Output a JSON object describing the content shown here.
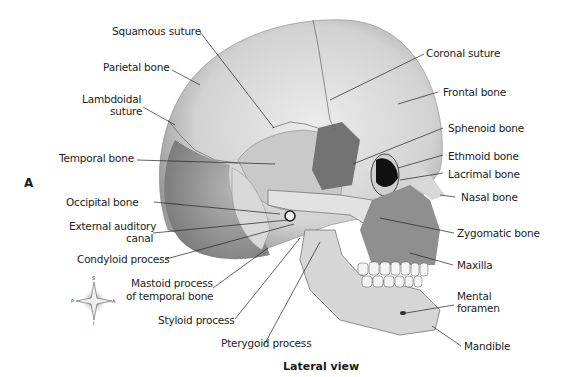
{
  "figure": {
    "panel_letter": "A",
    "caption": "Lateral view"
  },
  "labels": {
    "squamous_suture": "Squamous suture",
    "parietal_bone": "Parietal bone",
    "lambdoidal_suture_1": "Lambdoidal",
    "lambdoidal_suture_2": "suture",
    "temporal_bone": "Temporal bone",
    "occipital_bone": "Occipital bone",
    "external_auditory_1": "External auditory",
    "external_auditory_2": "canal",
    "condyloid_process": "Condyloid process",
    "mastoid_1": "Mastoid process",
    "mastoid_2": "of temporal bone",
    "styloid_process": "Styloid process",
    "pterygoid_process": "Pterygoid process",
    "coronal_suture": "Coronal suture",
    "frontal_bone": "Frontal bone",
    "sphenoid_bone": "Sphenoid bone",
    "ethmoid_bone": "Ethmoid bone",
    "lacrimal_bone": "Lacrimal bone",
    "nasal_bone": "Nasal bone",
    "zygomatic_bone": "Zygomatic bone",
    "maxilla": "Maxilla",
    "mental_foramen_1": "Mental",
    "mental_foramen_2": "foramen",
    "mandible": "Mandible"
  },
  "compass": {
    "superior": "S",
    "inferior": "I",
    "anterior": "A",
    "posterior": "P"
  },
  "colors": {
    "bone_light": "#e4e4e4",
    "bone_mid": "#bdbdbd",
    "bone_dark": "#8a8a8a",
    "sphenoid": "#6f6f6f",
    "orbit": "#111111",
    "leader_line": "#222222"
  }
}
